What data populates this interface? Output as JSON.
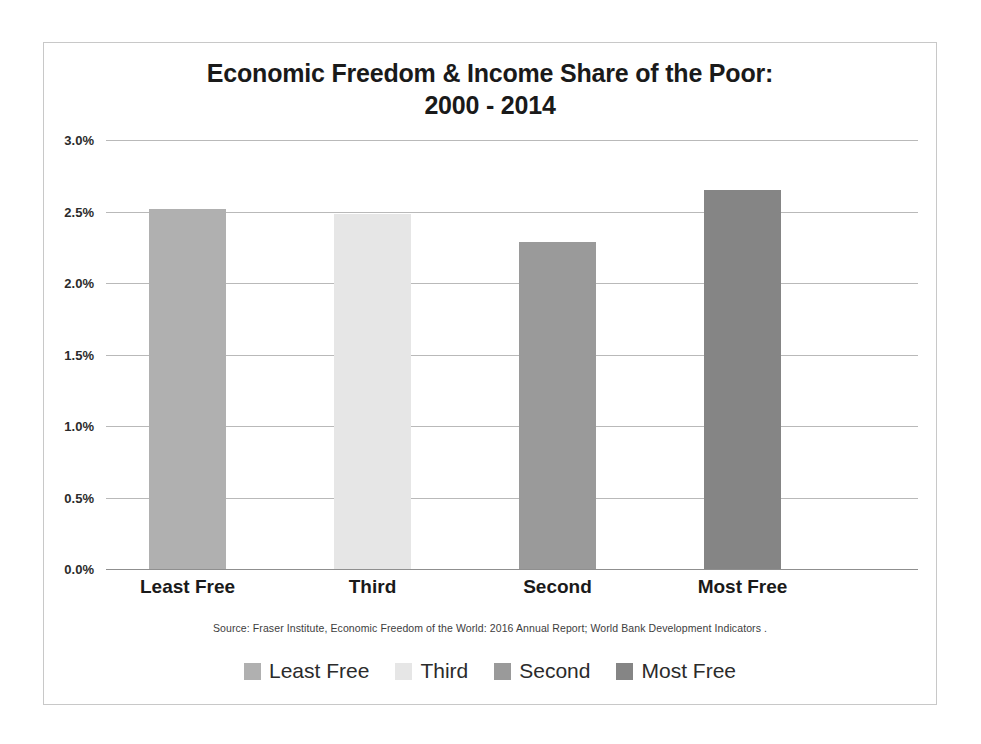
{
  "chart_data": {
    "type": "bar",
    "title": "Economic Freedom & Income Share of the Poor:",
    "subtitle": "2000 - 2014",
    "title_line1": "Economic Freedom & Income Share of the Poor:",
    "title_line2": "2000 - 2014",
    "categories": [
      "Least Free",
      "Third",
      "Second",
      "Most Free"
    ],
    "values": [
      2.52,
      2.48,
      2.29,
      2.65
    ],
    "value_labels": [
      "2.52%",
      "2.48%",
      "2.29%",
      "2.65%"
    ],
    "xlabel": "",
    "ylabel": "",
    "ylim": [
      0.0,
      3.0
    ],
    "ytick_values": [
      3.0,
      2.5,
      2.0,
      1.5,
      1.0,
      0.5,
      0.0
    ],
    "ytick_labels": [
      "3.0%",
      "2.5%",
      "2.0%",
      "1.5%",
      "1.0%",
      "0.5%",
      "0.0%"
    ],
    "grid": true,
    "legend_position": "bottom",
    "legend": [
      {
        "label": "Least Free",
        "color": "#b0b0b0"
      },
      {
        "label": "Third",
        "color": "#e6e6e6"
      },
      {
        "label": "Second",
        "color": "#9a9a9a"
      },
      {
        "label": "Most Free",
        "color": "#858585"
      }
    ],
    "series": [
      {
        "name": "Income Share of the Poor",
        "values": [
          2.52,
          2.48,
          2.29,
          2.65
        ],
        "colors": [
          "#b0b0b0",
          "#e6e6e6",
          "#9a9a9a",
          "#858585"
        ]
      }
    ],
    "source_note": "Source: Fraser Institute, Economic Freedom of the World: 2016 Annual Report;  World Bank Development Indicators ."
  },
  "frame": {
    "border_color": "#c8c8c8",
    "background": "#ffffff"
  }
}
